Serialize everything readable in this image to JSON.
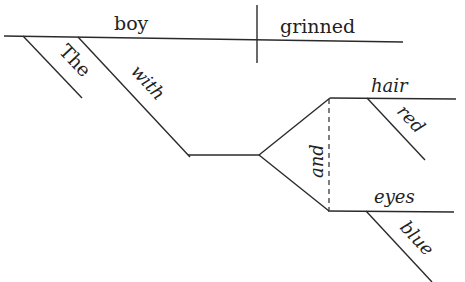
{
  "diagram": {
    "type": "Reed-Kellogg sentence diagram",
    "subject": {
      "word": "boy",
      "modifiers": {
        "article": "The",
        "preposition": "with"
      }
    },
    "predicate": {
      "word": "grinned"
    },
    "conjunction": "and",
    "compound_objects": [
      {
        "word": "hair",
        "modifier": "red"
      },
      {
        "word": "eyes",
        "modifier": "blue"
      }
    ]
  },
  "colors": {
    "line": "#2a2a2a",
    "text": "#222222",
    "background": "#ffffff"
  }
}
